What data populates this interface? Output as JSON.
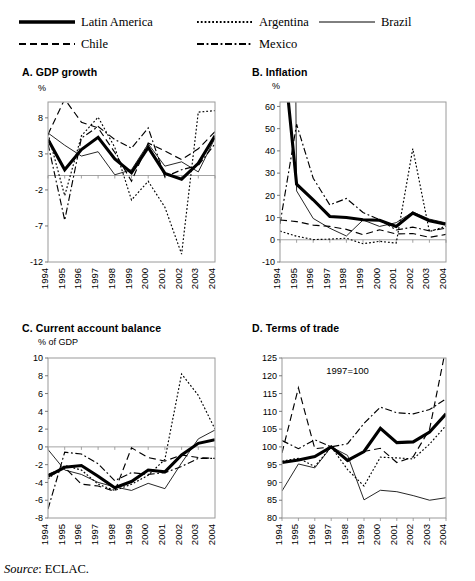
{
  "legend": {
    "entries": [
      {
        "label": "Latin America",
        "style": "thick-solid",
        "x": 18,
        "y": 14
      },
      {
        "label": "Argentina",
        "style": "fine-dotted",
        "x": 196,
        "y": 14
      },
      {
        "label": "Brazil",
        "style": "thin-solid",
        "x": 318,
        "y": 14
      },
      {
        "label": "Chile",
        "style": "dashed",
        "x": 18,
        "y": 36
      },
      {
        "label": "Mexico",
        "style": "dash-dot",
        "x": 196,
        "y": 36
      }
    ]
  },
  "source": {
    "prefix": "Source",
    "text": ": ECLAC."
  },
  "chart_data": [
    {
      "id": "A",
      "type": "line",
      "title": "A. GDP growth",
      "ylabel": "%",
      "xlabel": "",
      "grid": false,
      "legend_position": "top-external",
      "ylim": [
        -12,
        10.2
      ],
      "yticks": [
        8,
        3,
        -2,
        -7,
        -12
      ],
      "zero_line": 0,
      "categories": [
        "1994",
        "1995",
        "1996",
        "1997",
        "1998",
        "1999",
        "2000",
        "2001",
        "2002",
        "2003",
        "2004"
      ],
      "series": [
        {
          "name": "Latin America",
          "style": "thick-solid",
          "values": [
            5.0,
            0.8,
            3.6,
            5.3,
            2.3,
            0.4,
            3.9,
            0.3,
            -0.5,
            1.7,
            5.5
          ]
        },
        {
          "name": "Argentina",
          "style": "fine-dotted",
          "values": [
            5.8,
            -2.8,
            5.5,
            8.1,
            3.9,
            -3.4,
            -0.8,
            -4.4,
            -10.9,
            8.8,
            9.0
          ]
        },
        {
          "name": "Brazil",
          "style": "thin-solid",
          "values": [
            5.9,
            4.2,
            2.7,
            3.3,
            0.1,
            0.8,
            4.4,
            1.3,
            1.9,
            0.5,
            5.2
          ]
        },
        {
          "name": "Chile",
          "style": "dashed",
          "values": [
            5.7,
            10.6,
            7.4,
            6.6,
            3.2,
            -0.8,
            4.5,
            3.4,
            2.2,
            3.7,
            6.1
          ]
        },
        {
          "name": "Mexico",
          "style": "dash-dot",
          "values": [
            4.4,
            -6.2,
            5.2,
            6.8,
            5.0,
            3.8,
            6.6,
            -0.2,
            0.8,
            1.4,
            4.4
          ]
        }
      ]
    },
    {
      "id": "B",
      "type": "line",
      "title": "B. Inflation",
      "ylabel": "%",
      "xlabel": "",
      "grid": false,
      "legend_position": "top-external",
      "ylim": [
        -10,
        62
      ],
      "yticks": [
        60,
        50,
        40,
        30,
        20,
        10,
        0,
        -10
      ],
      "zero_line": 0,
      "categories": [
        "1994",
        "1995",
        "1996",
        "1997",
        "1998",
        "1999",
        "2000",
        "2001",
        "2002",
        "2003",
        "2004"
      ],
      "series": [
        {
          "name": "Latin America",
          "style": "thick-solid",
          "values": [
            100.0,
            25.0,
            18.0,
            10.5,
            10.0,
            9.0,
            8.8,
            6.0,
            12.0,
            8.5,
            7.0
          ]
        },
        {
          "name": "Argentina",
          "style": "fine-dotted",
          "values": [
            3.9,
            1.6,
            0.1,
            0.3,
            0.7,
            -1.8,
            -0.7,
            -1.5,
            41.0,
            3.7,
            6.1
          ]
        },
        {
          "name": "Brazil",
          "style": "thin-solid",
          "values": [
            929.0,
            22.0,
            9.6,
            5.2,
            1.7,
            8.9,
            6.0,
            7.7,
            12.5,
            9.3,
            7.6
          ]
        },
        {
          "name": "Chile",
          "style": "dashed",
          "values": [
            8.9,
            8.2,
            6.6,
            6.0,
            4.7,
            2.3,
            4.5,
            2.6,
            2.8,
            1.1,
            2.4
          ]
        },
        {
          "name": "Mexico",
          "style": "dash-dot",
          "values": [
            7.1,
            52.0,
            27.7,
            15.7,
            18.6,
            12.3,
            9.0,
            4.4,
            5.7,
            4.0,
            5.2
          ]
        }
      ]
    },
    {
      "id": "C",
      "type": "line",
      "title": "C. Current account balance",
      "ylabel": "% of GDP",
      "xlabel": "",
      "grid": false,
      "legend_position": "top-external",
      "ylim": [
        -8,
        10
      ],
      "yticks": [
        10,
        8,
        6,
        4,
        2,
        0,
        -2,
        -4,
        -6,
        -8
      ],
      "zero_line": 0,
      "categories": [
        "1994",
        "1995",
        "1996",
        "1997",
        "1998",
        "1999",
        "2000",
        "2001",
        "2002",
        "2003",
        "2004"
      ],
      "series": [
        {
          "name": "Latin America",
          "style": "thick-solid",
          "values": [
            -3.3,
            -2.3,
            -2.1,
            -3.3,
            -4.6,
            -3.9,
            -2.6,
            -2.8,
            -0.9,
            0.4,
            0.8
          ]
        },
        {
          "name": "Argentina",
          "style": "fine-dotted",
          "values": [
            -3.6,
            -2.1,
            -2.6,
            -4.2,
            -4.9,
            -4.2,
            -3.2,
            -1.4,
            8.2,
            5.8,
            2.0
          ]
        },
        {
          "name": "Brazil",
          "style": "thin-solid",
          "values": [
            -0.3,
            -2.6,
            -3.1,
            -4.0,
            -4.5,
            -4.9,
            -4.1,
            -4.7,
            -1.8,
            0.9,
            1.9
          ]
        },
        {
          "name": "Chile",
          "style": "dashed",
          "values": [
            -3.1,
            -2.3,
            -4.2,
            -4.4,
            -5.0,
            -0.1,
            -1.2,
            -1.6,
            -0.9,
            -1.2,
            -1.3
          ]
        },
        {
          "name": "Mexico",
          "style": "dash-dot",
          "values": [
            -7.0,
            -0.6,
            -0.8,
            -1.9,
            -3.8,
            -2.9,
            -3.1,
            -2.9,
            -2.2,
            -1.3,
            -1.3
          ]
        }
      ]
    },
    {
      "id": "D",
      "type": "line",
      "title": "D. Terms of trade",
      "ylabel": "",
      "xlabel": "",
      "annotation": "1997=100",
      "grid": false,
      "legend_position": "top-external",
      "ylim": [
        80,
        125
      ],
      "yticks": [
        125,
        120,
        115,
        110,
        105,
        100,
        95,
        90,
        85,
        80
      ],
      "categories": [
        "1994",
        "1995",
        "1996",
        "1997",
        "1998",
        "1999",
        "2000",
        "2001",
        "2002",
        "2003",
        "2004"
      ],
      "series": [
        {
          "name": "Latin America",
          "style": "thick-solid",
          "values": [
            95.6,
            96.3,
            97.3,
            100.0,
            96.2,
            98.7,
            105.2,
            101.2,
            101.4,
            104.2,
            109.3
          ]
        },
        {
          "name": "Argentina",
          "style": "fine-dotted",
          "values": [
            96.0,
            96.8,
            94.5,
            100.0,
            93.6,
            89.0,
            97.1,
            96.9,
            96.6,
            100.8,
            106.0
          ]
        },
        {
          "name": "Brazil",
          "style": "thin-solid",
          "values": [
            87.6,
            95.2,
            94.1,
            100.0,
            97.6,
            85.1,
            87.8,
            87.4,
            86.3,
            85.0,
            85.7
          ]
        },
        {
          "name": "Chile",
          "style": "dashed",
          "values": [
            98.3,
            116.6,
            99.5,
            100.0,
            95.9,
            98.7,
            99.6,
            95.6,
            97.2,
            105.0,
            128.0
          ]
        },
        {
          "name": "Mexico",
          "style": "dash-dot",
          "values": [
            101.8,
            99.5,
            102.0,
            100.0,
            100.9,
            106.6,
            111.2,
            109.6,
            109.3,
            110.5,
            113.5
          ]
        }
      ]
    }
  ]
}
